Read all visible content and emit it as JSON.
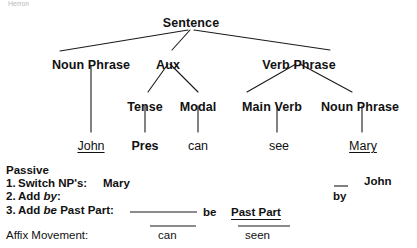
{
  "page": {
    "top_faint_text_left": "Herron",
    "top_faint_text_right": ""
  },
  "tree": {
    "title": "Sentence",
    "nodes": [
      {
        "id": "sentence",
        "label": "Sentence",
        "x": 191,
        "y": 16
      },
      {
        "id": "np1",
        "label": "Noun Phrase",
        "x": 91,
        "y": 58
      },
      {
        "id": "aux",
        "label": "Aux",
        "x": 168,
        "y": 58
      },
      {
        "id": "vp",
        "label": "Verb Phrase",
        "x": 299,
        "y": 58
      },
      {
        "id": "tense",
        "label": "Tense",
        "x": 145,
        "y": 100
      },
      {
        "id": "modal",
        "label": "Modal",
        "x": 198,
        "y": 100
      },
      {
        "id": "mainverb",
        "label": "Main Verb",
        "x": 272,
        "y": 100
      },
      {
        "id": "np2",
        "label": "Noun Phrase",
        "x": 360,
        "y": 100
      }
    ],
    "leaves": [
      {
        "id": "john",
        "label": "John",
        "x": 91,
        "y": 139,
        "bold": false,
        "underline": true
      },
      {
        "id": "pres",
        "label": "Pres",
        "x": 145,
        "y": 139,
        "bold": true,
        "underline": false
      },
      {
        "id": "can",
        "label": "can",
        "x": 198,
        "y": 139,
        "bold": false,
        "underline": false
      },
      {
        "id": "see",
        "label": "see",
        "x": 279,
        "y": 139,
        "bold": false,
        "underline": false
      },
      {
        "id": "mary",
        "label": "Mary",
        "x": 363,
        "y": 139,
        "bold": false,
        "underline": true
      }
    ]
  },
  "passive": {
    "heading": "Passive",
    "steps": [
      {
        "num": "1.",
        "text": "Switch NP's:",
        "italic_word": ""
      },
      {
        "num": "2.",
        "text": "Add",
        "italic_word": "by",
        "suffix": ":"
      },
      {
        "num": "3.",
        "text": "Add",
        "italic_word": "be",
        "suffix": " Past Part:"
      }
    ],
    "step1_value": "Mary",
    "step3_blank_label": "",
    "step3_be": "be",
    "step3_pastpart": "Past Part",
    "by_label": "by",
    "john_label": "John"
  },
  "affix": {
    "label": "Affix Movement:",
    "value_can": "can",
    "value_seen": "seen"
  },
  "colors": {
    "ink": "#111111",
    "background": "#ffffff",
    "faint": "#b9b9b9"
  }
}
